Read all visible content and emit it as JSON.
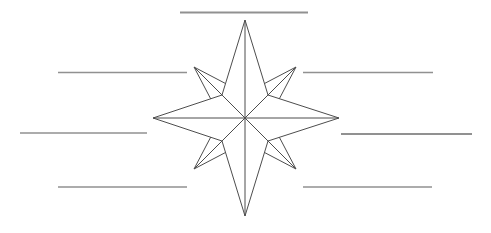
{
  "canvas": {
    "width": 491,
    "height": 233,
    "background": "#ffffff"
  },
  "figure": {
    "type": "compass-rose-worksheet",
    "stroke_color": "#4d4d4d",
    "stroke_width": 1,
    "fill_color": "#ffffff",
    "center": [
      245,
      118
    ],
    "cardinal_tips": {
      "n": [
        245,
        20
      ],
      "e": [
        339,
        118
      ],
      "s": [
        245,
        216
      ],
      "w": [
        153,
        118
      ]
    },
    "inner_vertices": {
      "ne": [
        268,
        95
      ],
      "se": [
        268,
        141
      ],
      "sw": [
        222,
        141
      ],
      "nw": [
        222,
        95
      ]
    },
    "diagonal_tips": {
      "nw": [
        194,
        67
      ],
      "ne": [
        296,
        67
      ],
      "sw": [
        194,
        169
      ],
      "se": [
        296,
        169
      ]
    },
    "diagonal_side_vertices": {
      "nw": [
        [
          227.2,
          84.4
        ],
        [
          211.4,
          100.2
        ]
      ],
      "ne": [
        [
          262.8,
          84.4
        ],
        [
          278.6,
          100.2
        ]
      ],
      "sw": [
        [
          227.2,
          151.6
        ],
        [
          211.4,
          135.8
        ]
      ],
      "se": [
        [
          262.8,
          151.6
        ],
        [
          278.6,
          135.8
        ]
      ]
    }
  },
  "answer_lines": {
    "color": "#919191",
    "items": [
      {
        "position": "north",
        "x1": 180,
        "y1": 12.5,
        "x2": 308,
        "y2": 12.5,
        "thickness": 2.2
      },
      {
        "position": "northwest",
        "x1": 58,
        "y1": 72.5,
        "x2": 187,
        "y2": 72.5,
        "thickness": 1.4
      },
      {
        "position": "northeast",
        "x1": 303,
        "y1": 72.5,
        "x2": 433,
        "y2": 72.5,
        "thickness": 1.4
      },
      {
        "position": "west",
        "x1": 20,
        "y1": 133,
        "x2": 147,
        "y2": 133,
        "thickness": 1.4
      },
      {
        "position": "east",
        "x1": 341,
        "y1": 134,
        "x2": 472,
        "y2": 134,
        "thickness": 1.8
      },
      {
        "position": "southwest",
        "x1": 58,
        "y1": 187,
        "x2": 187,
        "y2": 187,
        "thickness": 1.4
      },
      {
        "position": "southeast",
        "x1": 303,
        "y1": 187,
        "x2": 432,
        "y2": 187,
        "thickness": 1.4
      }
    ]
  }
}
